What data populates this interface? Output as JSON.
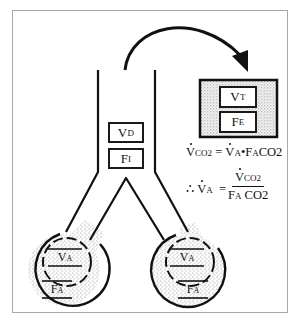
{
  "diagram": {
    "airway": {
      "dead_space_volume": {
        "main": "V",
        "sub": "D"
      },
      "inspired_fraction": {
        "main": "F",
        "sub": "I"
      }
    },
    "collection_bag": {
      "tidal_volume": {
        "main": "V",
        "sub": "T"
      },
      "expired_fraction": {
        "main": "F",
        "sub": "E"
      }
    },
    "alveoli": [
      {
        "volume": {
          "main": "V",
          "sub": "A"
        },
        "fraction": {
          "main": "F",
          "sub": "A"
        }
      },
      {
        "volume": {
          "main": "V",
          "sub": "A"
        },
        "fraction": {
          "main": "F",
          "sub": "A"
        }
      }
    ],
    "equations": {
      "eq1": {
        "lhs_main": "V",
        "lhs_sub": "CO2",
        "equals": "=",
        "rhs_v": "V",
        "rhs_v_sub": "A",
        "dot": "•",
        "rhs_f": "F",
        "rhs_f_sub": "A",
        "rhs_gas": "CO2"
      },
      "eq2": {
        "therefore": "∴",
        "lhs_main": "V",
        "lhs_sub": "A",
        "equals": "=",
        "num_main": "V",
        "num_sub": "CO2",
        "den_main": "F",
        "den_sub": "A",
        "den_gas": "CO2"
      }
    },
    "colors": {
      "stroke": "#111111",
      "stipple": "#8a8a8a",
      "frame": "#a8a8a8"
    }
  }
}
